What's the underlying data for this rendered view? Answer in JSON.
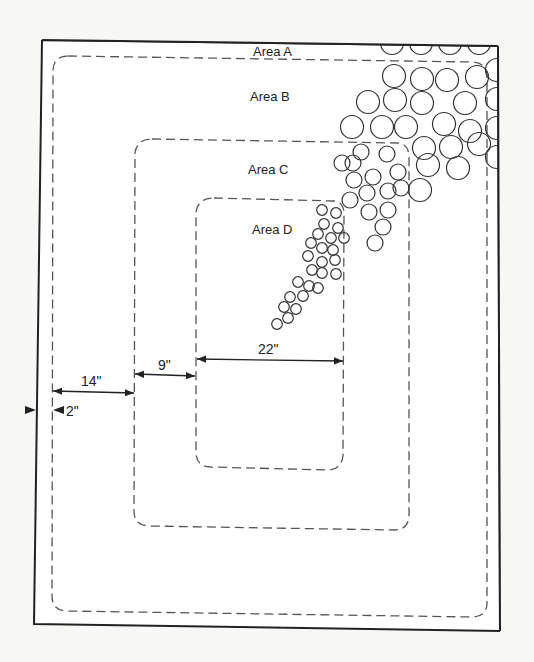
{
  "diagram": {
    "type": "nested-area-layout",
    "areas": [
      {
        "id": "A",
        "label": "Area A"
      },
      {
        "id": "B",
        "label": "Area B"
      },
      {
        "id": "C",
        "label": "Area C"
      },
      {
        "id": "D",
        "label": "Area D"
      }
    ],
    "dimensions": [
      {
        "id": "outer-gap",
        "label": "2\""
      },
      {
        "id": "a-to-b",
        "label": "14\""
      },
      {
        "id": "b-to-c",
        "label": "9\""
      },
      {
        "id": "d-width",
        "label": "22\""
      }
    ],
    "colors": {
      "paper": "#f7f7f5",
      "ink": "#222222",
      "dash": "#555555"
    },
    "circles": {
      "large": [
        [
          392,
          43
        ],
        [
          421,
          43
        ],
        [
          450,
          43
        ],
        [
          479,
          43
        ],
        [
          497,
          70
        ],
        [
          497,
          99
        ],
        [
          497,
          128
        ],
        [
          497,
          157
        ],
        [
          394,
          76
        ],
        [
          422,
          79
        ],
        [
          447,
          80
        ],
        [
          477,
          77
        ],
        [
          368,
          102
        ],
        [
          395,
          100
        ],
        [
          422,
          103
        ],
        [
          465,
          103
        ],
        [
          352,
          127
        ],
        [
          382,
          127
        ],
        [
          406,
          127
        ],
        [
          444,
          124
        ],
        [
          470,
          131
        ],
        [
          424,
          148
        ],
        [
          451,
          147
        ],
        [
          479,
          144
        ],
        [
          428,
          165
        ],
        [
          458,
          168
        ],
        [
          420,
          190
        ]
      ],
      "medium": [
        [
          342,
          163
        ],
        [
          361,
          152
        ],
        [
          387,
          154
        ],
        [
          354,
          180
        ],
        [
          373,
          177
        ],
        [
          398,
          172
        ],
        [
          367,
          193
        ],
        [
          388,
          191
        ],
        [
          350,
          200
        ],
        [
          369,
          212
        ],
        [
          388,
          210
        ],
        [
          383,
          227
        ],
        [
          375,
          243
        ],
        [
          353,
          163
        ],
        [
          401,
          188
        ]
      ],
      "small": [
        [
          322,
          210
        ],
        [
          336,
          213
        ],
        [
          324,
          224
        ],
        [
          338,
          228
        ],
        [
          318,
          234
        ],
        [
          331,
          238
        ],
        [
          344,
          238
        ],
        [
          311,
          243
        ],
        [
          322,
          248
        ],
        [
          333,
          250
        ],
        [
          308,
          256
        ],
        [
          322,
          262
        ],
        [
          335,
          260
        ],
        [
          312,
          270
        ],
        [
          322,
          273
        ],
        [
          336,
          274
        ],
        [
          298,
          282
        ],
        [
          309,
          286
        ],
        [
          318,
          288
        ],
        [
          290,
          297
        ],
        [
          303,
          296
        ],
        [
          284,
          307
        ],
        [
          296,
          309
        ],
        [
          288,
          318
        ],
        [
          277,
          324
        ]
      ]
    }
  }
}
